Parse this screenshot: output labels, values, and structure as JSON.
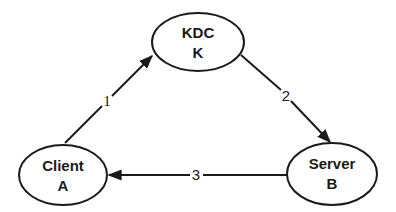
{
  "diagram": {
    "type": "protocol-flow",
    "nodes": [
      {
        "id": "kdc",
        "line1": "KDC",
        "line2": "K"
      },
      {
        "id": "client",
        "line1": "Client",
        "line2": "A"
      },
      {
        "id": "server",
        "line1": "Server",
        "line2": "B"
      }
    ],
    "edges": [
      {
        "from": "client",
        "to": "kdc",
        "label": "1"
      },
      {
        "from": "kdc",
        "to": "server",
        "label": "2"
      },
      {
        "from": "server",
        "to": "client",
        "label": "3"
      }
    ],
    "colors": {
      "stroke": "#1a1a1a",
      "background": "#ffffff"
    }
  }
}
